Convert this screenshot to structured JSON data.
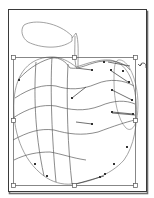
{
  "figure": {
    "colors": {
      "background": "#ffffff",
      "frame": "#3a3a3a",
      "frame_shadow": "#6e6e6e",
      "path_stroke": "#8a8a8a",
      "mesh_stroke": "#5a5a5a",
      "handle_fill": "#ffffff",
      "handle_stroke": "#555555",
      "anchor_fill": "#333333"
    },
    "bounding_box": {
      "x": 13,
      "y": 57,
      "width": 122,
      "height": 128,
      "handles": [
        [
          13,
          57
        ],
        [
          74,
          57
        ],
        [
          135,
          57
        ],
        [
          13,
          120
        ],
        [
          135,
          120
        ],
        [
          13,
          185
        ],
        [
          74,
          185
        ],
        [
          135,
          185
        ]
      ]
    },
    "rotate_cursor_icon": "rotate-icon"
  }
}
